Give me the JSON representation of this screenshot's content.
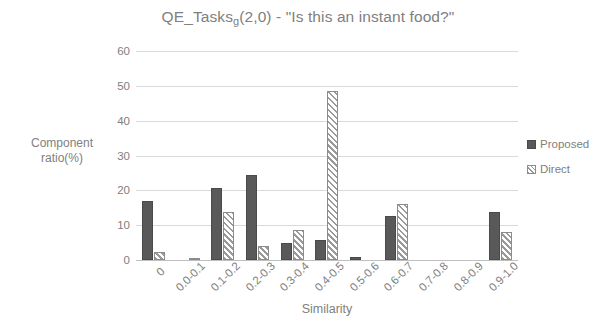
{
  "chart_data": {
    "type": "bar",
    "title_main_before": "QE_Tasks",
    "title_subscript": "g",
    "title_main_after": "(2,0) - \"Is this an instant food?\"",
    "xlabel": "Similarity",
    "ylabel": "Component ratio(%)",
    "ylabel_line1": "Component",
    "ylabel_line2": "ratio(%)",
    "ylim": [
      0,
      60
    ],
    "yticks": [
      0,
      10,
      20,
      30,
      40,
      50,
      60
    ],
    "ytick_labels": [
      "0",
      "10",
      "20",
      "30",
      "40",
      "50",
      "60"
    ],
    "grid": true,
    "legend_position": "right",
    "categories": [
      "0",
      "0.0-0.1",
      "0.1-0.2",
      "0.2-0.3",
      "0.3-0.4",
      "0.4-0.5",
      "0.5-0.6",
      "0.6-0.7",
      "0.7-0.8",
      "0.8-0.9",
      "0.9-1.0"
    ],
    "series": [
      {
        "name": "Proposed",
        "color": "#595959",
        "pattern": "solid",
        "values": [
          17.0,
          0.0,
          20.8,
          24.5,
          5.0,
          5.8,
          1.0,
          12.5,
          0.0,
          0.0,
          13.8
        ]
      },
      {
        "name": "Direct",
        "color": "#ffffff",
        "pattern": "diagonal-hatch",
        "values": [
          2.2,
          0.5,
          13.7,
          4.0,
          8.5,
          48.5,
          0.0,
          16.0,
          0.0,
          0.0,
          8.0
        ]
      }
    ]
  },
  "legend": {
    "items": [
      {
        "label": "Proposed"
      },
      {
        "label": "Direct"
      }
    ]
  },
  "colors": {
    "proposed": "#595959",
    "direct_outline": "#8c8c8c",
    "gridline": "#d9d9d9",
    "text": "#808080",
    "background": "#ffffff"
  }
}
